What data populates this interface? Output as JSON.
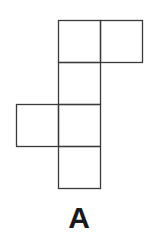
{
  "figure": {
    "label": "A",
    "line_color": "#3a3a3a",
    "cell_size": 42,
    "origin": [
      16,
      20
    ],
    "cells": [
      {
        "col": 1,
        "row": 0
      },
      {
        "col": 2,
        "row": 0
      },
      {
        "col": 1,
        "row": 1
      },
      {
        "col": 0,
        "row": 2
      },
      {
        "col": 1,
        "row": 2
      },
      {
        "col": 1,
        "row": 3
      }
    ]
  }
}
